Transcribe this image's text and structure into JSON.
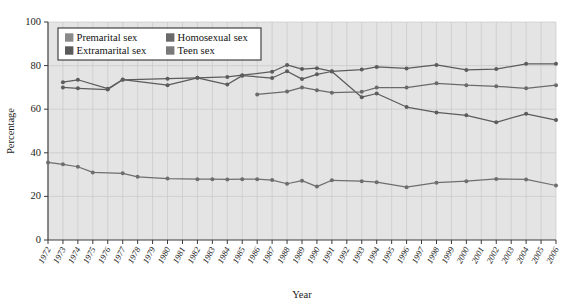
{
  "chart_data": {
    "type": "line",
    "title": "",
    "xlabel": "Year",
    "ylabel": "Percentage",
    "grid": true,
    "legend_position": "top-left",
    "xlim": [
      1972,
      2006
    ],
    "ylim": [
      0,
      100
    ],
    "ytick_labels": [
      "0",
      "20",
      "40",
      "60",
      "80",
      "100"
    ],
    "yticks": [
      0,
      20,
      40,
      60,
      80,
      100
    ],
    "categories": [
      "1972",
      "1973",
      "1974",
      "1975",
      "1976",
      "1977",
      "1978",
      "1979",
      "1980",
      "1981",
      "1982",
      "1983",
      "1984",
      "1985",
      "1986",
      "1987",
      "1988",
      "1989",
      "1990",
      "1991",
      "1992",
      "1993",
      "1994",
      "1995",
      "1996",
      "1997",
      "1998",
      "1999",
      "2000",
      "2001",
      "2002",
      "2003",
      "2004",
      "2005",
      "2006"
    ],
    "series": [
      {
        "name": "Premarital sex",
        "color": "#6e6e6e",
        "x": [
          1972,
          1973,
          1974,
          1975,
          1977,
          1978,
          1980,
          1982,
          1983,
          1984,
          1985,
          1986,
          1987,
          1988,
          1989,
          1990,
          1991,
          1993,
          1994,
          1996,
          1998,
          2000,
          2002,
          2004,
          2006
        ],
        "values": [
          35.6,
          34.7,
          33.6,
          31.0,
          30.6,
          29.0,
          28.2,
          27.9,
          27.9,
          27.8,
          27.9,
          27.9,
          27.5,
          25.8,
          27.2,
          24.5,
          27.4,
          27.0,
          26.5,
          24.2,
          26.3,
          27.0,
          28.0,
          27.8,
          25.0
        ]
      },
      {
        "name": "Extramarital sex",
        "color": "#5c5c5c",
        "x": [
          1973,
          1974,
          1976,
          1977,
          1980,
          1982,
          1984,
          1985,
          1987,
          1988,
          1989,
          1990,
          1991,
          1993,
          1994,
          1996,
          1998,
          2000,
          2002,
          2004,
          2006
        ],
        "values": [
          70.0,
          69.6,
          69.0,
          73.5,
          74.0,
          74.4,
          74.8,
          75.6,
          77.2,
          80.3,
          78.4,
          78.8,
          77.4,
          78.2,
          79.4,
          78.7,
          80.3,
          78.0,
          78.4,
          80.8,
          80.8
        ]
      },
      {
        "name": "Homosexual sex",
        "color": "#5c5c5c",
        "x": [
          1973,
          1974,
          1976,
          1977,
          1980,
          1982,
          1984,
          1985,
          1987,
          1988,
          1989,
          1990,
          1991,
          1993,
          1994,
          1996,
          1998,
          2000,
          2002,
          2004,
          2006
        ],
        "values": [
          72.4,
          73.5,
          69.4,
          73.6,
          71.0,
          74.4,
          71.3,
          75.4,
          74.3,
          77.4,
          73.8,
          76.0,
          77.3,
          65.5,
          67.2,
          61.0,
          58.5,
          57.2,
          54.0,
          57.9,
          55.0
        ]
      },
      {
        "name": "Teen sex",
        "color": "#6a6a6a",
        "x": [
          1986,
          1988,
          1989,
          1990,
          1991,
          1993,
          1994,
          1996,
          1998,
          2000,
          2002,
          2004,
          2006
        ],
        "values": [
          66.8,
          68.1,
          70.0,
          68.7,
          67.6,
          68.0,
          69.9,
          69.9,
          71.9,
          71.0,
          70.5,
          69.6,
          71.0
        ]
      }
    ]
  },
  "legend": {
    "entries": [
      {
        "label": "Premarital sex",
        "swatch": "#8a8a8a"
      },
      {
        "label": "Homosexual sex",
        "swatch": "#6a6a6a"
      },
      {
        "label": "Extramarital sex",
        "swatch": "#5a5a5a"
      },
      {
        "label": "Teen sex",
        "swatch": "#7a7a7a"
      }
    ]
  }
}
